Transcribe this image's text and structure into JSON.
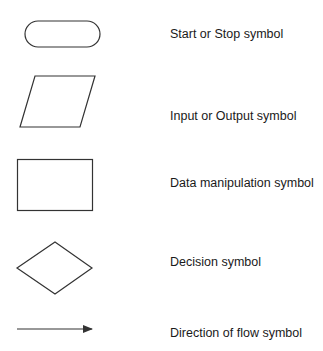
{
  "diagram": {
    "type": "flowchart-symbol-legend",
    "stroke_color": "#333333",
    "background": "#ffffff",
    "symbols": [
      {
        "shape": "terminator",
        "icon": "rounded-rectangle-icon",
        "label": "Start or Stop symbol"
      },
      {
        "shape": "parallelogram",
        "icon": "parallelogram-icon",
        "label": "Input or Output symbol"
      },
      {
        "shape": "rectangle",
        "icon": "rectangle-icon",
        "label": "Data manipulation symbol"
      },
      {
        "shape": "diamond",
        "icon": "diamond-icon",
        "label": "Decision symbol"
      },
      {
        "shape": "arrow",
        "icon": "arrow-right-icon",
        "label": "Direction of flow symbol"
      }
    ]
  }
}
